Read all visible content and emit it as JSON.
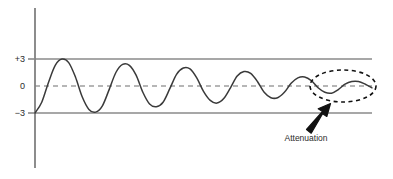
{
  "figure": {
    "background_color": "#ffffff",
    "width": 393,
    "height": 179
  },
  "axes": {
    "vertical_axis_name": "amplitude-axis",
    "vertical_axis_color": "#808080",
    "vertical_axis_x": 35,
    "vertical_axis_y_top": 8,
    "vertical_axis_y_bottom": 168,
    "plot_left": 35,
    "plot_right": 372,
    "tick_labels": [
      {
        "text": "+3",
        "value": 3,
        "y": 59
      },
      {
        "text": "0",
        "value": 0,
        "y": 86
      },
      {
        "text": "−3",
        "value": -3,
        "y": 113
      }
    ],
    "gridlines": [
      {
        "name": "upper-bound-line",
        "value": 3,
        "y": 59,
        "style": "solid",
        "color": "#8a8a8a"
      },
      {
        "name": "zero-reference-line",
        "value": 0,
        "y": 86,
        "style": "dashed",
        "color": "#6e6e6e"
      },
      {
        "name": "lower-bound-line",
        "value": -3,
        "y": 113,
        "style": "solid",
        "color": "#8a8a8a"
      }
    ]
  },
  "annotations": {
    "callout_label": "Attenuation",
    "callout_label_x": 306,
    "callout_label_y": 138,
    "ellipse": {
      "name": "attenuation-highlight-ellipse",
      "cx": 343,
      "cy": 86,
      "rx": 33,
      "ry": 16,
      "style": "dashed",
      "color": "#111111"
    },
    "arrow": {
      "name": "attenuation-arrow",
      "tail_x": 306,
      "tail_y": 128,
      "tip_x": 329,
      "tip_y": 104,
      "color": "#111111"
    }
  },
  "chart_data": {
    "type": "line",
    "title": "",
    "subtitle": "",
    "xlabel": "",
    "ylabel": "",
    "xlim": [
      0,
      1
    ],
    "ylim": [
      -3.6,
      3.6
    ],
    "grid": true,
    "legend_position": "none",
    "annotations": [
      "Attenuation"
    ],
    "ytick_labels": [
      "+3",
      "0",
      "−3"
    ],
    "ytick_values": [
      3,
      0,
      -3
    ],
    "series": [
      {
        "name": "attenuating-signal",
        "color": "#3a3a3a",
        "description": "Damped oscillation: amplitude decays from 3 to near 0 from left to right",
        "amplitude_envelope": [
          3.0,
          3.0,
          2.6,
          2.3,
          2.0,
          1.7,
          1.4,
          1.15,
          0.9,
          0.7,
          0.55,
          0.45,
          0.38,
          0.32
        ],
        "cycles": 13,
        "x": [
          0.0,
          0.02,
          0.04,
          0.06,
          0.08,
          0.1,
          0.12,
          0.14,
          0.16,
          0.18,
          0.2,
          0.22,
          0.24,
          0.26,
          0.28,
          0.3,
          0.32,
          0.34,
          0.36,
          0.38,
          0.4,
          0.42,
          0.44,
          0.46,
          0.48,
          0.5,
          0.52,
          0.54,
          0.56,
          0.58,
          0.6,
          0.62,
          0.64,
          0.66,
          0.68,
          0.7,
          0.72,
          0.74,
          0.76,
          0.78,
          0.8,
          0.82,
          0.84,
          0.86,
          0.88,
          0.9,
          0.92,
          0.94,
          0.96,
          0.98,
          1.0
        ],
        "y": [
          -3.0,
          -1.8,
          0.4,
          2.3,
          3.0,
          2.6,
          1.0,
          -1.2,
          -2.6,
          -2.9,
          -2.2,
          -0.4,
          1.5,
          2.4,
          2.3,
          1.2,
          -0.7,
          -2.0,
          -2.3,
          -1.8,
          -0.3,
          1.3,
          2.0,
          1.9,
          0.9,
          -0.6,
          -1.6,
          -1.9,
          -1.4,
          -0.2,
          1.1,
          1.6,
          1.4,
          0.5,
          -0.7,
          -1.3,
          -1.3,
          -0.7,
          0.3,
          0.9,
          1.0,
          0.6,
          -0.2,
          -0.7,
          -0.8,
          -0.4,
          0.2,
          0.5,
          0.5,
          0.2,
          -0.2
        ]
      }
    ]
  }
}
